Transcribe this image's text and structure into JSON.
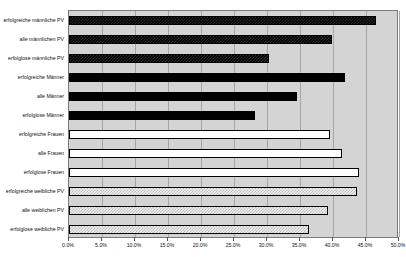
{
  "chart_data": {
    "type": "bar",
    "orientation": "horizontal",
    "title": "",
    "xlabel": "",
    "ylabel": "",
    "xlim": [
      0,
      50
    ],
    "xticks": [
      "0.0%",
      "5.0%",
      "10.0%",
      "15.0%",
      "20.0%",
      "25.0%",
      "30.0%",
      "35.0%",
      "40.0%",
      "45.0%",
      "50.0%"
    ],
    "xtick_values": [
      0,
      5,
      10,
      15,
      20,
      25,
      30,
      35,
      40,
      45,
      50
    ],
    "grid": true,
    "legend": "none",
    "categories": [
      "erfolgreiche männliche PV",
      "alle männlichen PV",
      "erfolglose männliche PV",
      "erfolgreiche Männer",
      "alle Männer",
      "erfolglose Männer",
      "erfolgreiche Frauen",
      "alle Frauen",
      "erfolglose Frauen",
      "erfolgreiche weibliche PV",
      "alle weiblichen PV",
      "erfolglose weibliche PV"
    ],
    "values": [
      46.5,
      39.8,
      30.3,
      41.8,
      34.6,
      28.2,
      39.5,
      41.4,
      44.0,
      43.7,
      39.2,
      36.4
    ],
    "bar_styles": [
      "dark",
      "dark",
      "dark",
      "solid",
      "solid",
      "solid",
      "open",
      "open",
      "open",
      "light",
      "light",
      "light"
    ]
  },
  "axis": {
    "x_unit": "%"
  }
}
